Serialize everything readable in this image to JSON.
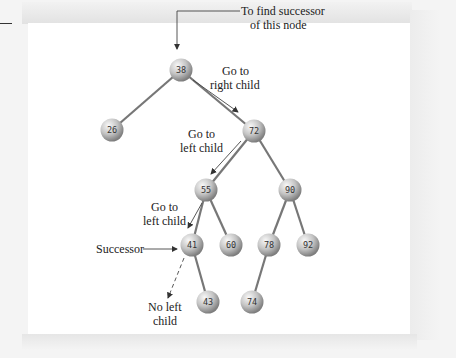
{
  "diagram": {
    "nodes": [
      {
        "id": "n38",
        "value": "38",
        "x": 181,
        "y": 70
      },
      {
        "id": "n26",
        "value": "26",
        "x": 112,
        "y": 130
      },
      {
        "id": "n72",
        "value": "72",
        "x": 254,
        "y": 131
      },
      {
        "id": "n55",
        "value": "55",
        "x": 206,
        "y": 190
      },
      {
        "id": "n90",
        "value": "90",
        "x": 290,
        "y": 190
      },
      {
        "id": "n41",
        "value": "41",
        "x": 192,
        "y": 245
      },
      {
        "id": "n60",
        "value": "60",
        "x": 231,
        "y": 245
      },
      {
        "id": "n78",
        "value": "78",
        "x": 269,
        "y": 245
      },
      {
        "id": "n92",
        "value": "92",
        "x": 308,
        "y": 245
      },
      {
        "id": "n43",
        "value": "43",
        "x": 208,
        "y": 302
      },
      {
        "id": "n74",
        "value": "74",
        "x": 252,
        "y": 302
      }
    ],
    "edges": [
      [
        "38",
        "26"
      ],
      [
        "38",
        "72"
      ],
      [
        "72",
        "55"
      ],
      [
        "72",
        "90"
      ],
      [
        "55",
        "41"
      ],
      [
        "55",
        "60"
      ],
      [
        "90",
        "78"
      ],
      [
        "90",
        "92"
      ],
      [
        "41",
        "43"
      ],
      [
        "78",
        "74"
      ]
    ],
    "annotations": {
      "start_line1": "To find successor",
      "start_line2": "of this node",
      "right_line1": "Go to",
      "right_line2": "right child",
      "left1_line1": "Go to",
      "left1_line2": "left child",
      "left2_line1": "Go to",
      "left2_line2": "left child",
      "successor": "Successor",
      "noleft_line1": "No left",
      "noleft_line2": "child"
    },
    "colors": {
      "node_light": "#f4f4f4",
      "node_dark": "#8a8a8a",
      "edge": "#777777",
      "arrow": "#333333"
    }
  }
}
